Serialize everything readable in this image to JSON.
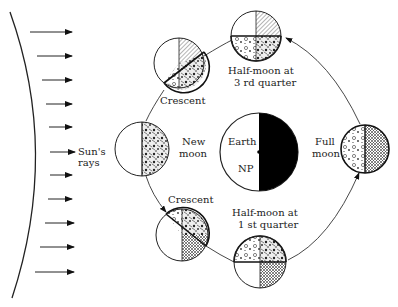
{
  "diagram": {
    "type": "moon-phases",
    "sun": {
      "label_line1": "Sun's",
      "label_line2": "rays",
      "ray_count": 11
    },
    "earth": {
      "label": "Earth",
      "pole_label": "NP"
    },
    "phases": [
      {
        "id": "half-moon-3rd",
        "line1": "Half-moon at",
        "line2": "3 rd quarter"
      },
      {
        "id": "crescent-top",
        "line1": "Crescent"
      },
      {
        "id": "new-moon",
        "line1": "New",
        "line2": "moon"
      },
      {
        "id": "crescent-bottom",
        "line1": "Crescent"
      },
      {
        "id": "half-moon-1st",
        "line1": "Half-moon at",
        "line2": "1 st quarter"
      },
      {
        "id": "full-moon",
        "line1": "Full",
        "line2": "moon"
      }
    ],
    "colors": {
      "ink": "#222222",
      "background": "#ffffff"
    }
  }
}
